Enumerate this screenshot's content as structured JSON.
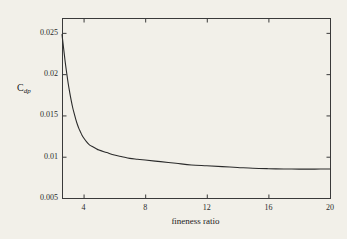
{
  "chart_data": {
    "type": "line",
    "title": "",
    "subtitle": "",
    "xlabel": "fineness ratio",
    "ylabel": "C_dp",
    "ylabel_base": "C",
    "ylabel_sub": "dp",
    "xlim": [
      2.6,
      20
    ],
    "ylim": [
      0.005,
      0.0268
    ],
    "xticks": [
      4,
      8,
      12,
      16,
      20
    ],
    "xtick_labels": [
      "4",
      "8",
      "12",
      "16",
      "20"
    ],
    "yticks": [
      0.005,
      0.01,
      0.015,
      0.02,
      0.025
    ],
    "ytick_labels": [
      "0.005",
      "0.01",
      "0.015",
      "0.02",
      "0.025"
    ],
    "grid": false,
    "legend": null,
    "line_color": "#2b2b2b",
    "axis_color": "#3a3a3a",
    "background_color": "#f2f0e9",
    "series": [
      {
        "name": "pressure drag coefficient",
        "x": [
          2.6,
          2.7,
          2.8,
          2.9,
          3.0,
          3.1,
          3.2,
          3.3,
          3.4,
          3.5,
          3.6,
          3.7,
          3.8,
          3.9,
          4.0,
          4.2,
          4.4,
          4.6,
          4.8,
          5.0,
          5.5,
          6.0,
          6.5,
          7.0,
          7.5,
          8.0,
          9.0,
          10.0,
          11.0,
          12.0,
          13.0,
          14.0,
          15.0,
          16.0,
          17.0,
          18.0,
          19.0,
          20.0
        ],
        "values": [
          0.0248,
          0.0232,
          0.0216,
          0.0202,
          0.0189,
          0.0178,
          0.0168,
          0.0159,
          0.0152,
          0.0145,
          0.0139,
          0.0134,
          0.013,
          0.0126,
          0.0123,
          0.0118,
          0.0114,
          0.0112,
          0.011,
          0.0108,
          0.0105,
          0.0102,
          0.01,
          0.0098,
          0.0097,
          0.0096,
          0.0094,
          0.0092,
          0.009,
          0.0089,
          0.0088,
          0.0087,
          0.0086,
          0.00855,
          0.00852,
          0.0085,
          0.0085,
          0.00852
        ]
      }
    ]
  },
  "axes": {
    "frame": {
      "left": 62,
      "top": 18,
      "right": 330,
      "bottom": 198
    }
  }
}
